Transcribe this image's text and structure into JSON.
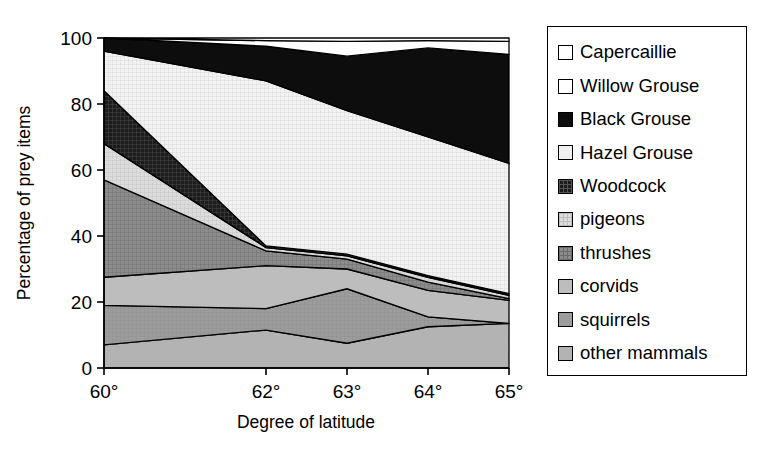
{
  "chart_data": {
    "type": "area",
    "title": "",
    "xlabel": "Degree of latitude",
    "ylabel": "Percentage of prey items",
    "categories": [
      "60°",
      "62°",
      "63°",
      "64°",
      "65°"
    ],
    "x_numeric": [
      60,
      62,
      63,
      64,
      65
    ],
    "ylim": [
      0,
      100
    ],
    "yticks": [
      0,
      20,
      40,
      60,
      80,
      100
    ],
    "ytick_labels": [
      "0",
      "20",
      "40",
      "60",
      "80",
      "100"
    ],
    "xtick_labels": [
      "60°",
      "62°",
      "63°",
      "64°",
      "65°"
    ],
    "grid": false,
    "legend_position": "right",
    "stacked": true,
    "stack_order_bottom_to_top": [
      "other mammals",
      "squirrels",
      "corvids",
      "thrushes",
      "pigeons",
      "Woodcock",
      "Hazel Grouse",
      "Black Grouse",
      "Willow Grouse",
      "Capercaillie"
    ],
    "series": [
      {
        "name": "Capercaillie",
        "fill": "#ffffff",
        "pattern": "solid",
        "values": [
          0.0,
          0.8,
          1.0,
          0.8,
          1.0
        ]
      },
      {
        "name": "Willow Grouse",
        "fill": "#ffffff",
        "pattern": "solid",
        "values": [
          0.0,
          1.7,
          4.5,
          2.2,
          4.0
        ]
      },
      {
        "name": "Black Grouse",
        "fill": "#0d0d0d",
        "pattern": "solid-dark",
        "values": [
          4.0,
          10.5,
          16.5,
          27.0,
          33.0
        ]
      },
      {
        "name": "Hazel Grouse",
        "fill": "#efefef",
        "pattern": "fine-grid",
        "values": [
          12.0,
          50.0,
          43.5,
          42.0,
          39.5
        ]
      },
      {
        "name": "Woodcock",
        "fill": "#2a2a2a",
        "pattern": "dark-grid",
        "values": [
          16.0,
          0.5,
          0.5,
          0.5,
          0.5
        ]
      },
      {
        "name": "pigeons",
        "fill": "#d8d8d8",
        "pattern": "light-grid",
        "values": [
          11.0,
          1.0,
          1.0,
          1.5,
          1.0
        ]
      },
      {
        "name": "thrushes",
        "fill": "#8a8a8a",
        "pattern": "mid-grid",
        "values": [
          29.5,
          4.5,
          3.0,
          2.5,
          0.5
        ]
      },
      {
        "name": "corvids",
        "fill": "#bcbcbc",
        "pattern": "light-solid",
        "values": [
          8.5,
          13.0,
          6.0,
          8.0,
          7.0
        ]
      },
      {
        "name": "squirrels",
        "fill": "#9e9e9e",
        "pattern": "mid-solid",
        "values": [
          12.0,
          6.5,
          16.5,
          3.0,
          0.0
        ]
      },
      {
        "name": "other mammals",
        "fill": "#b4b4b4",
        "pattern": "plain-grey",
        "values": [
          7.0,
          11.5,
          7.5,
          12.5,
          13.5
        ]
      }
    ],
    "cumulative_tops_bottom_to_top": {
      "other mammals": [
        7.0,
        11.5,
        7.5,
        12.5,
        13.5
      ],
      "squirrels": [
        19.0,
        18.0,
        24.0,
        15.5,
        13.5
      ],
      "corvids": [
        27.5,
        31.0,
        30.0,
        23.5,
        20.5
      ],
      "thrushes": [
        57.0,
        35.5,
        33.0,
        26.0,
        21.0
      ],
      "pigeons": [
        68.0,
        36.5,
        34.0,
        27.5,
        22.0
      ],
      "Woodcock": [
        84.0,
        37.0,
        34.5,
        28.0,
        22.5
      ],
      "Hazel Grouse": [
        96.0,
        87.0,
        78.0,
        70.0,
        62.0
      ],
      "Black Grouse": [
        100.0,
        97.5,
        94.5,
        97.0,
        95.0
      ],
      "Willow Grouse": [
        100.0,
        99.2,
        99.0,
        99.2,
        99.0
      ],
      "Capercaillie": [
        100.0,
        100.0,
        100.0,
        100.0,
        100.0
      ]
    }
  },
  "legend": {
    "items": [
      {
        "label": "Capercaillie",
        "swatch": "swatch-capercaillie"
      },
      {
        "label": "Willow Grouse",
        "swatch": "swatch-willow-grouse"
      },
      {
        "label": "Black Grouse",
        "swatch": "swatch-black-grouse"
      },
      {
        "label": "Hazel Grouse",
        "swatch": "swatch-hazel-grouse"
      },
      {
        "label": "Woodcock",
        "swatch": "swatch-woodcock"
      },
      {
        "label": "pigeons",
        "swatch": "swatch-pigeons"
      },
      {
        "label": "thrushes",
        "swatch": "swatch-thrushes"
      },
      {
        "label": "corvids",
        "swatch": "swatch-corvids"
      },
      {
        "label": "squirrels",
        "swatch": "swatch-squirrels"
      },
      {
        "label": "other mammals",
        "swatch": "swatch-other-mammals"
      }
    ]
  },
  "axes": {
    "y_title": "Percentage of prey items",
    "x_title": "Degree of latitude",
    "y_ticks": [
      "100",
      "80",
      "60",
      "40",
      "20",
      "0"
    ],
    "x_ticks": [
      "60°",
      "62°",
      "63°",
      "64°",
      "65°"
    ]
  }
}
